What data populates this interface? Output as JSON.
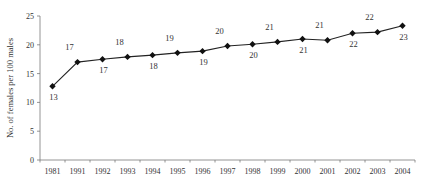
{
  "chart_data": {
    "type": "line",
    "title": "",
    "xlabel": "",
    "ylabel": "No. of females per 100 males",
    "categories": [
      "1981",
      "1991",
      "1992",
      "1993",
      "1994",
      "1995",
      "1996",
      "1997",
      "1998",
      "1999",
      "2000",
      "2001",
      "2002",
      "2003",
      "2004"
    ],
    "series": [
      {
        "name": "Females per 100 males",
        "values": [
          12.8,
          17.0,
          17.5,
          17.9,
          18.2,
          18.6,
          18.9,
          19.8,
          20.1,
          20.5,
          21.0,
          20.8,
          22.0,
          22.2,
          23.3
        ],
        "data_labels": [
          "13",
          "17",
          "17",
          "18",
          "18",
          "19",
          "19",
          "20",
          "20",
          "21",
          "21",
          "21",
          "22",
          "22",
          "23"
        ],
        "label_positions": [
          "below",
          "above",
          "below",
          "above",
          "below",
          "above",
          "below",
          "above",
          "below",
          "above",
          "below",
          "above",
          "below",
          "above",
          "below"
        ],
        "marker": "diamond",
        "color": "#111111"
      }
    ],
    "ylim": [
      0,
      25
    ],
    "yticks": [
      0,
      5,
      10,
      15,
      20,
      25
    ],
    "grid": false,
    "legend": null
  }
}
